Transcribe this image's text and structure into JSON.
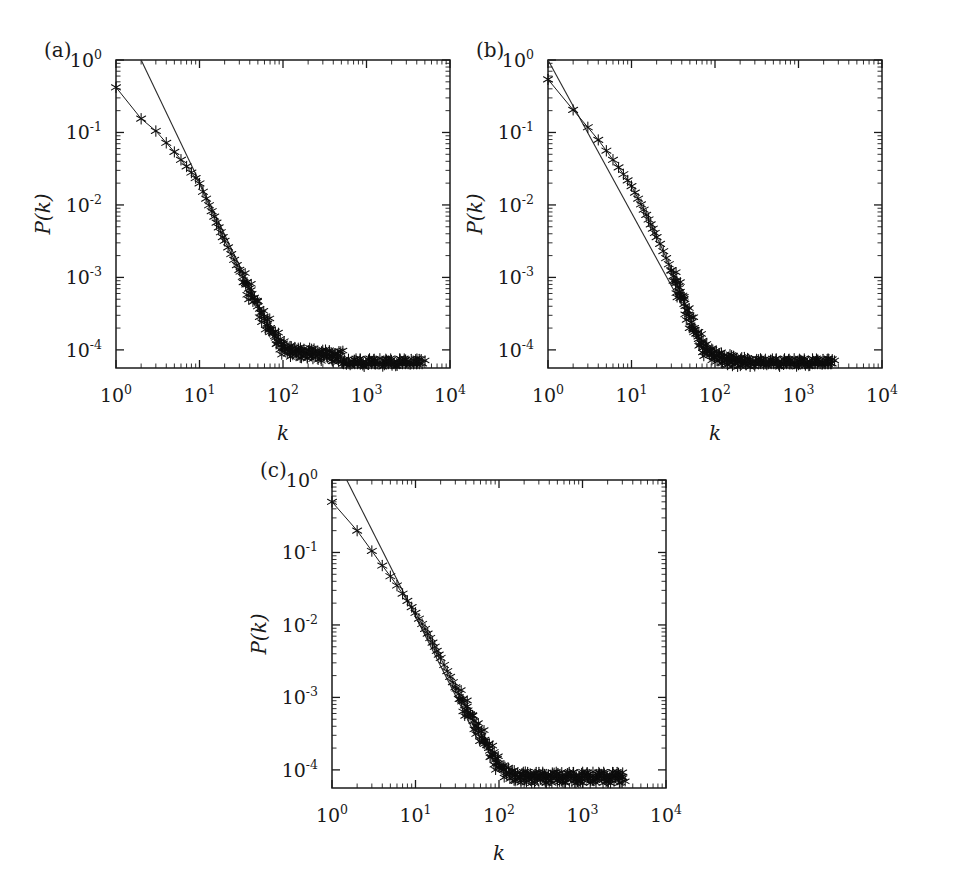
{
  "figure": {
    "panels": [
      {
        "tag": "(a)",
        "xlabel": "k",
        "ylabel": "P(k)",
        "xticks": [
          "10^0",
          "10^1",
          "10^2",
          "10^3",
          "10^4"
        ],
        "yticks": [
          "10^0",
          "10^-1",
          "10^-2",
          "10^-3",
          "10^-4"
        ]
      },
      {
        "tag": "(b)",
        "xlabel": "k",
        "ylabel": "P(k)",
        "xticks": [
          "10^0",
          "10^1",
          "10^2",
          "10^3",
          "10^4"
        ],
        "yticks": [
          "10^0",
          "10^-1",
          "10^-2",
          "10^-3",
          "10^-4"
        ]
      },
      {
        "tag": "(c)",
        "xlabel": "k",
        "ylabel": "P(k)",
        "xticks": [
          "10^0",
          "10^1",
          "10^2",
          "10^3",
          "10^4"
        ],
        "yticks": [
          "10^0",
          "10^-1",
          "10^-2",
          "10^-3",
          "10^-4"
        ]
      }
    ]
  },
  "chart_data": [
    {
      "type": "scatter",
      "panel": "(a)",
      "title": "",
      "xlabel": "k",
      "ylabel": "P(k)",
      "xscale": "log",
      "yscale": "log",
      "xlim": [
        1,
        10000
      ],
      "ylim": [
        4e-05,
        1
      ],
      "grid": false,
      "legend": null,
      "marker": "asterisk",
      "connected": true,
      "series": [
        {
          "name": "degree-distribution",
          "x": [
            1,
            2,
            3,
            4,
            5,
            6,
            7,
            8,
            9,
            10,
            11,
            12,
            13,
            14,
            15,
            16,
            17,
            18,
            19,
            20,
            22,
            24,
            26,
            28,
            30,
            33,
            36,
            39,
            42,
            46,
            50,
            55,
            60,
            65,
            70,
            76,
            82,
            89,
            96,
            104,
            112,
            121,
            131,
            142,
            153,
            165,
            179,
            193,
            209,
            226,
            244,
            264,
            285,
            308,
            333,
            360,
            389,
            420,
            454,
            490,
            530,
            573,
            619,
            669,
            723,
            781,
            844,
            912,
            986,
            1065,
            1151,
            1244,
            1344,
            1452,
            1569,
            1695,
            1832,
            1980,
            2139,
            2311,
            2497,
            2698,
            2915,
            3150,
            3404,
            3678,
            3974,
            4294,
            4640,
            5013
          ],
          "y": [
            0.42,
            0.155,
            0.105,
            0.072,
            0.054,
            0.042,
            0.034,
            0.028,
            0.0235,
            0.0198,
            0.0152,
            0.0122,
            0.0099,
            0.0082,
            0.0069,
            0.0057,
            0.0049,
            0.0042,
            0.0036,
            0.0032,
            0.0026,
            0.0021,
            0.00175,
            0.00148,
            0.00127,
            0.00102,
            0.00084,
            0.0007,
            0.00059,
            0.00048,
            0.0004,
            0.00032,
            0.00027,
            0.00023,
            0.0002,
            0.00017,
            0.000148,
            0.000128,
            0.000118,
            0.000105,
            0.0001,
            9.8e-05,
            9.6e-05,
            9.5e-05,
            9.4e-05,
            9.3e-05,
            9.2e-05,
            9.1e-05,
            9e-05,
            9e-05,
            8.9e-05,
            8.8e-05,
            8.7e-05,
            8.6e-05,
            8.5e-05,
            8.5e-05,
            8.4e-05,
            8.4e-05,
            8.3e-05,
            8.3e-05,
            6.5e-05,
            6.5e-05,
            6.5e-05,
            6.5e-05,
            6.5e-05,
            6.5e-05,
            6.5e-05,
            6.5e-05,
            6.5e-05,
            6.5e-05,
            6.5e-05,
            6.5e-05,
            6.5e-05,
            6.5e-05,
            6.5e-05,
            6.5e-05,
            6.5e-05,
            6.5e-05,
            6.5e-05,
            6.5e-05,
            6.5e-05,
            6.5e-05,
            6.5e-05,
            6.5e-05,
            6.5e-05,
            6.5e-05,
            6.5e-05,
            6.5e-05,
            6.5e-05
          ]
        }
      ],
      "fit_line": {
        "name": "power-law-reference",
        "x": [
          2.0,
          70
        ],
        "y": [
          1.0,
          0.00019
        ],
        "slope": -2.4
      }
    },
    {
      "type": "scatter",
      "panel": "(b)",
      "title": "",
      "xlabel": "k",
      "ylabel": "P(k)",
      "xscale": "log",
      "yscale": "log",
      "xlim": [
        1,
        10000
      ],
      "ylim": [
        4e-05,
        1
      ],
      "grid": false,
      "legend": null,
      "marker": "asterisk",
      "connected": true,
      "series": [
        {
          "name": "degree-distribution",
          "x": [
            1,
            2,
            3,
            4,
            5,
            6,
            7,
            8,
            9,
            10,
            11,
            12,
            13,
            14,
            15,
            16,
            17,
            18,
            19,
            20,
            22,
            24,
            26,
            28,
            30,
            32,
            34,
            36,
            38,
            40,
            43,
            46,
            49,
            52,
            56,
            60,
            64,
            69,
            74,
            79,
            85,
            91,
            98,
            105,
            113,
            121,
            130,
            140,
            150,
            161,
            173,
            186,
            200,
            215,
            231,
            248,
            266,
            286,
            307,
            330,
            354,
            380,
            408,
            438,
            470,
            505,
            542,
            582,
            625,
            671,
            720,
            773,
            830,
            891,
            957,
            1027,
            1103,
            1184,
            1271,
            1365,
            1465,
            1573,
            1689,
            1813,
            1947,
            2090,
            2244,
            2410,
            2500
          ],
          "y": [
            0.54,
            0.205,
            0.118,
            0.079,
            0.056,
            0.042,
            0.033,
            0.0265,
            0.0218,
            0.0182,
            0.0148,
            0.0122,
            0.0102,
            0.0086,
            0.0073,
            0.0063,
            0.0054,
            0.0047,
            0.0041,
            0.0036,
            0.0029,
            0.0023,
            0.00185,
            0.00152,
            0.00126,
            0.00105,
            0.00088,
            0.00074,
            0.00063,
            0.00054,
            0.00043,
            0.00035,
            0.00029,
            0.00024,
            0.0002,
            0.000168,
            0.000142,
            0.000122,
            0.000108,
            0.0001,
            9.4e-05,
            9e-05,
            8.6e-05,
            8.3e-05,
            8e-05,
            7.8e-05,
            7.6e-05,
            7.4e-05,
            7.3e-05,
            7.2e-05,
            7.1e-05,
            7e-05,
            6.9e-05,
            6.8e-05,
            6.7e-05,
            6.7e-05,
            6.6e-05,
            6.6e-05,
            6.5e-05,
            6.5e-05,
            6.5e-05,
            6.5e-05,
            6.5e-05,
            6.5e-05,
            6.5e-05,
            6.5e-05,
            6.5e-05,
            6.5e-05,
            6.5e-05,
            6.5e-05,
            6.5e-05,
            6.5e-05,
            6.5e-05,
            6.5e-05,
            6.5e-05,
            6.5e-05,
            6.5e-05,
            6.5e-05,
            6.5e-05,
            6.5e-05,
            6.5e-05,
            6.5e-05,
            6.5e-05,
            6.5e-05,
            6.5e-05,
            6.5e-05,
            6.5e-05,
            6.5e-05,
            6.5e-05
          ]
        }
      ],
      "fit_line": {
        "name": "power-law-reference",
        "x": [
          1.0,
          40
        ],
        "y": [
          1.0,
          0.00042
        ],
        "slope": -2.1
      }
    },
    {
      "type": "scatter",
      "panel": "(c)",
      "title": "",
      "xlabel": "k",
      "ylabel": "P(k)",
      "xscale": "log",
      "yscale": "log",
      "xlim": [
        1,
        10000
      ],
      "ylim": [
        4e-05,
        1
      ],
      "grid": false,
      "legend": null,
      "marker": "asterisk",
      "connected": true,
      "series": [
        {
          "name": "degree-distribution",
          "x": [
            1,
            2,
            3,
            4,
            5,
            6,
            7,
            8,
            9,
            10,
            11,
            12,
            13,
            14,
            15,
            16,
            17,
            18,
            19,
            20,
            22,
            24,
            26,
            28,
            30,
            33,
            36,
            39,
            42,
            45,
            49,
            53,
            57,
            62,
            67,
            72,
            78,
            84,
            91,
            98,
            106,
            114,
            123,
            133,
            144,
            155,
            168,
            181,
            196,
            211,
            228,
            246,
            266,
            287,
            310,
            335,
            362,
            391,
            422,
            456,
            492,
            532,
            574,
            620,
            670,
            723,
            781,
            844,
            911,
            984,
            1063,
            1148,
            1240,
            1339,
            1446,
            1562,
            1687,
            1822,
            1968,
            2125,
            2295,
            2479,
            2677,
            2892,
            3000
          ],
          "y": [
            0.5,
            0.2,
            0.105,
            0.066,
            0.047,
            0.035,
            0.027,
            0.0215,
            0.0176,
            0.0147,
            0.0122,
            0.0103,
            0.0088,
            0.0076,
            0.0066,
            0.0057,
            0.005,
            0.0044,
            0.0039,
            0.0035,
            0.0028,
            0.0023,
            0.00192,
            0.00162,
            0.00138,
            0.00112,
            0.00093,
            0.00078,
            0.00066,
            0.00057,
            0.00048,
            0.00041,
            0.00035,
            0.0003,
            0.00026,
            0.00022,
            0.000185,
            0.00016,
            0.000138,
            0.000122,
            0.00011,
            0.0001,
            9.4e-05,
            9e-05,
            8.6e-05,
            8.4e-05,
            8.2e-05,
            8e-05,
            8.2e-05,
            8e-05,
            8e-05,
            8e-05,
            8e-05,
            8e-05,
            8e-05,
            8e-05,
            8e-05,
            8e-05,
            8e-05,
            8e-05,
            8e-05,
            8e-05,
            8e-05,
            8e-05,
            8e-05,
            8e-05,
            8e-05,
            8e-05,
            8e-05,
            8e-05,
            8e-05,
            8e-05,
            8e-05,
            8e-05,
            8e-05,
            8e-05,
            8e-05,
            8e-05,
            8e-05,
            8e-05,
            8e-05,
            8e-05,
            8e-05,
            8e-05,
            8e-05
          ]
        }
      ],
      "fit_line": {
        "name": "power-law-reference",
        "x": [
          1.5,
          60
        ],
        "y": [
          1.0,
          0.00022
        ],
        "slope": -2.3
      }
    }
  ]
}
